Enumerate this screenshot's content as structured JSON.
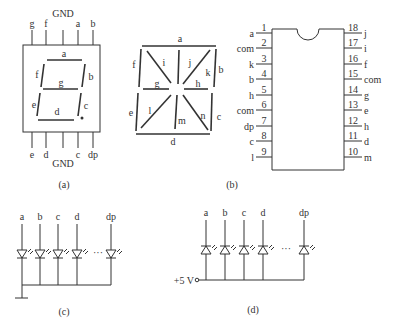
{
  "panel_a": {
    "caption": "(a)",
    "top_pins": [
      "g",
      "f",
      "GND",
      "a",
      "b"
    ],
    "bottom_pins": [
      "e",
      "d",
      "GND",
      "c",
      "dp"
    ],
    "segments": [
      "a",
      "b",
      "c",
      "d",
      "e",
      "f",
      "g"
    ]
  },
  "panel_b": {
    "caption": "(b)",
    "segments": [
      "a",
      "b",
      "c",
      "d",
      "e",
      "f",
      "g",
      "h",
      "i",
      "j",
      "k",
      "l",
      "m",
      "n"
    ]
  },
  "ic": {
    "left_pins": [
      {
        "num": "1",
        "label": "a"
      },
      {
        "num": "2",
        "label": "com"
      },
      {
        "num": "3",
        "label": "k"
      },
      {
        "num": "4",
        "label": "b"
      },
      {
        "num": "5",
        "label": "h"
      },
      {
        "num": "6",
        "label": "com"
      },
      {
        "num": "7",
        "label": "dp"
      },
      {
        "num": "8",
        "label": "c"
      },
      {
        "num": "9",
        "label": "l"
      }
    ],
    "right_pins": [
      {
        "num": "18",
        "label": "j"
      },
      {
        "num": "17",
        "label": "i"
      },
      {
        "num": "16",
        "label": "f"
      },
      {
        "num": "15",
        "label": "com"
      },
      {
        "num": "14",
        "label": "g"
      },
      {
        "num": "13",
        "label": "e"
      },
      {
        "num": "12",
        "label": "h"
      },
      {
        "num": "11",
        "label": "d"
      },
      {
        "num": "10",
        "label": "m"
      }
    ]
  },
  "panel_c": {
    "caption": "(c)",
    "inputs": [
      "a",
      "b",
      "c",
      "d",
      "dp"
    ],
    "ellipsis": "···"
  },
  "panel_d": {
    "caption": "(d)",
    "inputs": [
      "a",
      "b",
      "c",
      "d",
      "dp"
    ],
    "ellipsis": "···",
    "supply_label": "+5 V"
  }
}
